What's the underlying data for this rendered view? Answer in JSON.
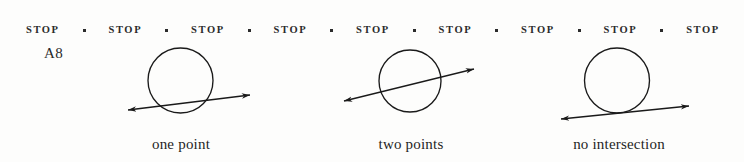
{
  "page": {
    "background_color": "#fdfdfc",
    "ink_color": "#1a1a1a",
    "width": 744,
    "height": 162
  },
  "header": {
    "repeat_label": "STOP",
    "repeat_count": 9,
    "separator_glyph": "square-dot",
    "separator_count": 8,
    "words": [
      "STOP",
      "STOP",
      "STOP",
      "STOP",
      "STOP",
      "STOP",
      "STOP",
      "STOP",
      "STOP"
    ]
  },
  "corner_label": {
    "text": "A8"
  },
  "figure": {
    "title": "",
    "panels": [
      {
        "id": "panel-one-point",
        "caption": "one point",
        "relationship": "tangent",
        "intersection_count": 1,
        "circle": {
          "cx": 180.5,
          "cy": 80.5,
          "r": 32.5
        },
        "line": {
          "x1": 128,
          "y1": 110,
          "x2": 250,
          "y2": 95
        },
        "arrowheads": "both"
      },
      {
        "id": "panel-two-points",
        "caption": "two points",
        "relationship": "secant",
        "intersection_count": 2,
        "circle": {
          "cx": 410,
          "cy": 81,
          "r": 31
        },
        "line": {
          "x1": 344,
          "y1": 101,
          "x2": 474,
          "y2": 69
        },
        "arrowheads": "both"
      },
      {
        "id": "panel-no-intersection",
        "caption": "no intersection",
        "relationship": "disjoint",
        "intersection_count": 0,
        "circle": {
          "cx": 617,
          "cy": 80.5,
          "r": 32.5
        },
        "line": {
          "x1": 561,
          "y1": 119,
          "x2": 689,
          "y2": 106
        },
        "arrowheads": "both"
      }
    ]
  }
}
